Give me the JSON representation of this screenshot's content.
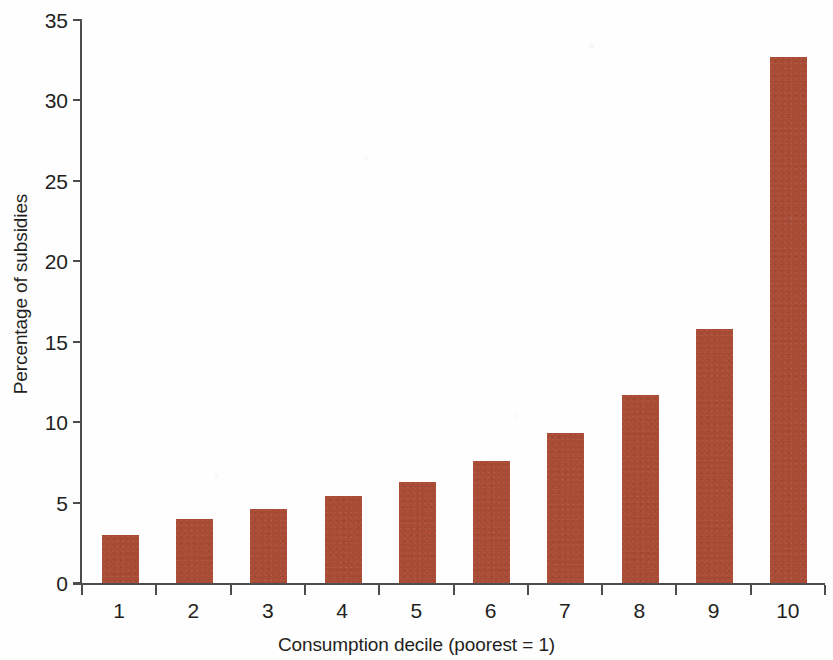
{
  "chart_data": {
    "type": "bar",
    "title": "",
    "subtitle": "",
    "xlabel": "Consumption decile (poorest = 1)",
    "ylabel": "Percentage of subsidies",
    "categories": [
      "1",
      "2",
      "3",
      "4",
      "5",
      "6",
      "7",
      "8",
      "9",
      "10"
    ],
    "values": [
      3.0,
      4.0,
      4.6,
      5.4,
      6.3,
      7.6,
      9.3,
      11.7,
      15.8,
      32.7
    ],
    "series": [
      {
        "name": "Percentage of subsidies",
        "values": [
          3.0,
          4.0,
          4.6,
          5.4,
          6.3,
          7.6,
          9.3,
          11.7,
          15.8,
          32.7
        ]
      }
    ],
    "ylim": [
      0,
      35
    ],
    "y_ticks": [
      0,
      5,
      10,
      15,
      20,
      25,
      30,
      35
    ],
    "y_tick_labels": [
      "0",
      "5",
      "10",
      "15",
      "20",
      "25",
      "30",
      "35"
    ],
    "x_tick_labels": [
      "1",
      "2",
      "3",
      "4",
      "5",
      "6",
      "7",
      "8",
      "9",
      "10"
    ],
    "grid": false,
    "legend": false,
    "legend_position": "none",
    "bar_color": "#a94b35",
    "axis_color": "#4d4d4f",
    "text_color": "#231f20",
    "background_color": "#ffffff"
  }
}
